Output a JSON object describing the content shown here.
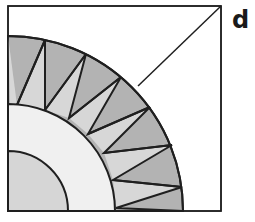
{
  "figure": {
    "label": "d",
    "colors": {
      "background": "#ffffff",
      "outline": "#1f1f1f",
      "outer_ring": "#b3b3b3",
      "spikes": "#d7d7d7",
      "middle_ring": "#f0f0f0",
      "core": "#d6d6d6"
    },
    "square": {
      "x": 8,
      "y": 6,
      "width": 213,
      "height": 205
    },
    "center": {
      "x": 8,
      "y": 211
    },
    "radii": {
      "outer": 175,
      "middle": 107,
      "core": 60
    },
    "spike_outer_points": [
      [
        8,
        36
      ],
      [
        45,
        40
      ],
      [
        86,
        54
      ],
      [
        121,
        77
      ],
      [
        150,
        107
      ],
      [
        172,
        145
      ],
      [
        182,
        187
      ],
      [
        183,
        211
      ]
    ],
    "spike_inner_points": [
      [
        17,
        105
      ],
      [
        45,
        110
      ],
      [
        69,
        118
      ],
      [
        88,
        134
      ],
      [
        104,
        153
      ],
      [
        113,
        180
      ],
      [
        116,
        208
      ]
    ],
    "diagonal": {
      "from": [
        138,
        86
      ],
      "to": [
        221,
        6
      ]
    }
  }
}
